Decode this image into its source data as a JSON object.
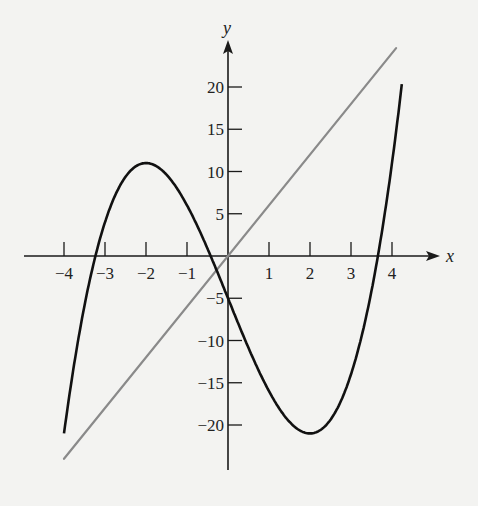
{
  "chart_data": {
    "type": "line",
    "title": "",
    "xlabel": "x",
    "ylabel": "y",
    "xlim": [
      -4.25,
      4.25
    ],
    "ylim": [
      -25,
      25
    ],
    "grid": false,
    "legend": null,
    "x_ticks": [
      -4,
      -3,
      -2,
      -1,
      1,
      2,
      3,
      4
    ],
    "x_tick_labels": [
      "−4",
      "−3",
      "−2",
      "−1",
      "1",
      "2",
      "3",
      "4"
    ],
    "y_ticks": [
      -20,
      -15,
      -10,
      -5,
      5,
      10,
      15,
      20
    ],
    "y_tick_labels": [
      "−20",
      "−15",
      "−10",
      "−5",
      "5",
      "10",
      "15",
      "20"
    ],
    "series": [
      {
        "name": "cubic",
        "expression": "y = x^3 - 12x - 5",
        "color": "#111111",
        "x": [
          -4,
          -3.5,
          -3.2,
          -3,
          -2.5,
          -2,
          -1.5,
          -1,
          -0.42,
          0,
          0.5,
          1,
          1.5,
          2,
          2.5,
          3,
          3.5,
          3.62,
          4,
          4.24
        ],
        "y": [
          -21,
          -5.9,
          0.6,
          4,
          9.4,
          11,
          9.6,
          6,
          0,
          -5,
          -10.9,
          -16,
          -19.6,
          -21,
          -19.4,
          -14,
          -4.1,
          0,
          11,
          20.3
        ],
        "key_points": {
          "local_max": [
            -2,
            11
          ],
          "local_min": [
            2,
            -21
          ],
          "y_intercept": [
            0,
            -5
          ],
          "roots": [
            -3.2,
            -0.42,
            3.62
          ]
        }
      },
      {
        "name": "line",
        "expression": "y = 6x",
        "color": "#8a8a8a",
        "x": [
          -4,
          4.1
        ],
        "y": [
          -24,
          24.6
        ]
      }
    ]
  }
}
